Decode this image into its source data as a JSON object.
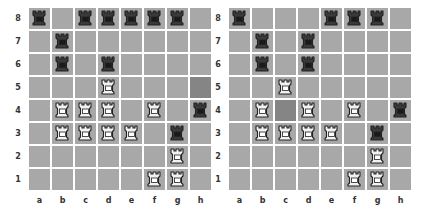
{
  "colors": {
    "square": "#a8a8a8",
    "highlight": "#858585",
    "white_piece_fill": "#f2f2f2",
    "black_piece_fill": "#3a3a3a",
    "outline": "#222222"
  },
  "files": [
    "a",
    "b",
    "c",
    "d",
    "e",
    "f",
    "g",
    "h"
  ],
  "ranks": [
    "8",
    "7",
    "6",
    "5",
    "4",
    "3",
    "2",
    "1"
  ],
  "boards": [
    {
      "name": "before",
      "highlight": [
        "h5"
      ],
      "pieces": {
        "a8": "black-rook",
        "c8": "black-rook",
        "d8": "black-rook",
        "e8": "black-rook",
        "f8": "black-rook",
        "g8": "black-rook",
        "b7": "black-rook",
        "b6": "black-rook",
        "d6": "black-rook",
        "d5": "white-rook",
        "b4": "white-rook",
        "c4": "white-rook",
        "d4": "white-rook",
        "f4": "white-rook",
        "h4": "black-rook",
        "b3": "white-rook",
        "c3": "white-rook",
        "d3": "white-rook",
        "e3": "white-rook",
        "g3": "black-rook",
        "g2": "white-rook",
        "f1": "white-rook",
        "g1": "white-rook"
      }
    },
    {
      "name": "after",
      "highlight": [
        "c4"
      ],
      "pieces": {
        "a8": "black-rook",
        "e8": "black-rook",
        "f8": "black-rook",
        "g8": "black-rook",
        "b7": "black-rook",
        "d7": "black-rook",
        "b6": "black-rook",
        "d6": "black-rook",
        "c5": "white-rook",
        "b4": "white-rook",
        "d4": "white-rook",
        "f4": "white-rook",
        "h4": "black-rook",
        "b3": "white-rook",
        "c3": "white-rook",
        "d3": "white-rook",
        "e3": "white-rook",
        "g3": "black-rook",
        "g2": "white-rook",
        "f1": "white-rook",
        "g1": "white-rook"
      }
    }
  ]
}
